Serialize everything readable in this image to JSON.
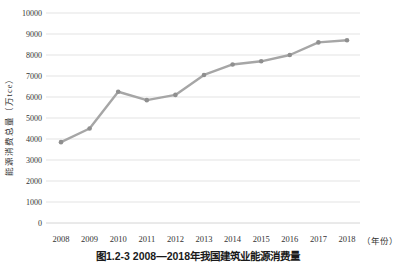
{
  "chart_data": {
    "type": "line",
    "caption": "图1.2-3  2008—2018年我国建筑业能源消费量",
    "ylabel": "能源消费总量（万tce）",
    "x_unit_label": "（年份）",
    "categories": [
      "2008",
      "2009",
      "2010",
      "2011",
      "2012",
      "2013",
      "2014",
      "2015",
      "2016",
      "2017",
      "2018"
    ],
    "series": [
      {
        "name": "能源消费总量",
        "values": [
          3850,
          4500,
          6250,
          5850,
          6100,
          7050,
          7550,
          7700,
          8000,
          8600,
          8700
        ]
      }
    ],
    "ylim": [
      0,
      10000
    ],
    "yticks": [
      0,
      1000,
      2000,
      3000,
      4000,
      5000,
      6000,
      7000,
      8000,
      9000,
      10000
    ],
    "grid": true,
    "legend_visible": false,
    "line_color": "#a6a6a6",
    "marker_color": "#8f8f8f",
    "gridline_color": "#dcdcdc",
    "baseline_color": "#c9c9c9",
    "tick_label_color": "#333333"
  }
}
